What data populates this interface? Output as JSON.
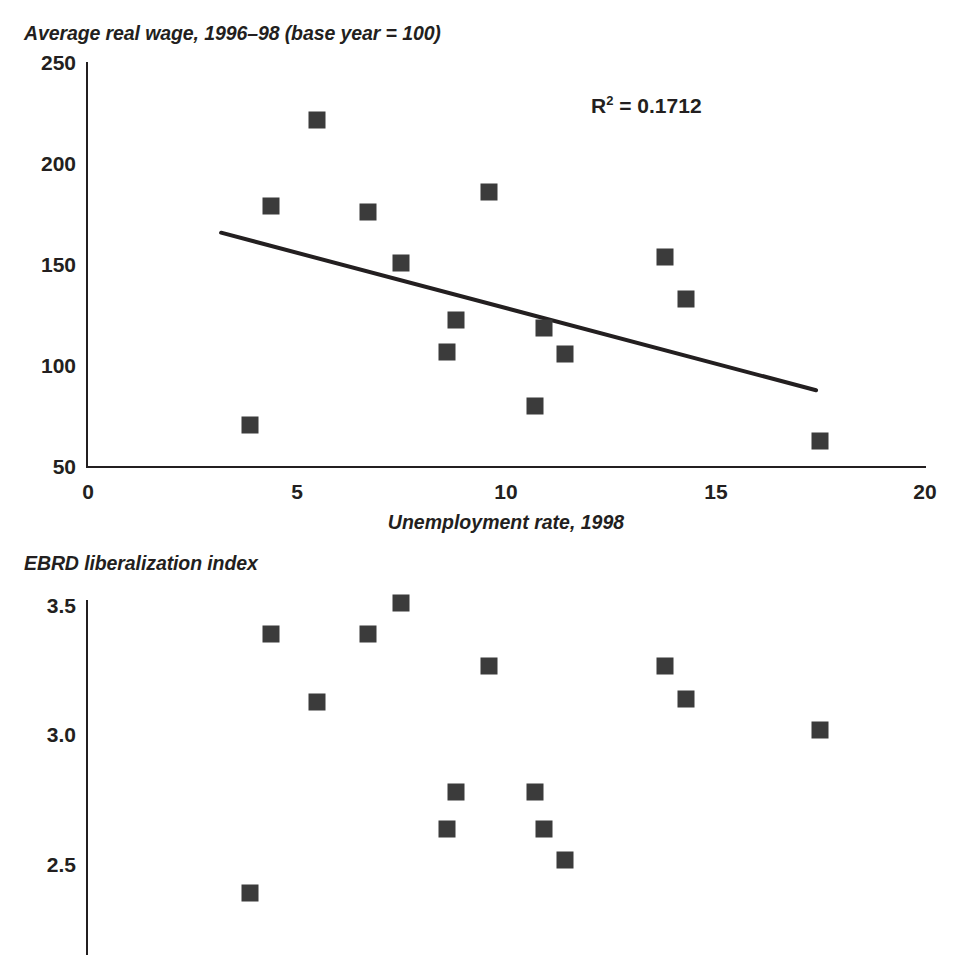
{
  "figure": {
    "marker_color": "#3b3b3b",
    "axis_color": "#231f20"
  },
  "chart_data": [
    {
      "type": "scatter",
      "title": "Average real wage, 1996–98 (base year = 100)",
      "xlabel": "Unemployment rate, 1998",
      "ylabel": "Average real wage, 1996–98 (base year = 100)",
      "xlim": [
        0,
        20
      ],
      "ylim": [
        50,
        250
      ],
      "xticks": [
        "0",
        "5",
        "10",
        "15",
        "20"
      ],
      "yticks": [
        "250",
        "200",
        "150",
        "100",
        "50"
      ],
      "grid": false,
      "legend": "none",
      "annotations": [
        {
          "text_prefix": "R",
          "text_sup": "2",
          "text_suffix": " = 0.1712",
          "full_text": "R2 = 0.1712"
        }
      ],
      "trendline": {
        "x0": 3.2,
        "y0": 166,
        "x1": 17.4,
        "y1": 88
      },
      "points": [
        {
          "x": 3.9,
          "y": 71
        },
        {
          "x": 4.4,
          "y": 179
        },
        {
          "x": 5.5,
          "y": 222
        },
        {
          "x": 6.7,
          "y": 176
        },
        {
          "x": 7.5,
          "y": 151
        },
        {
          "x": 8.6,
          "y": 107
        },
        {
          "x": 8.8,
          "y": 123
        },
        {
          "x": 9.6,
          "y": 186
        },
        {
          "x": 10.7,
          "y": 80
        },
        {
          "x": 10.9,
          "y": 119
        },
        {
          "x": 11.4,
          "y": 106
        },
        {
          "x": 13.8,
          "y": 154
        },
        {
          "x": 14.3,
          "y": 133
        },
        {
          "x": 17.5,
          "y": 63
        }
      ]
    },
    {
      "type": "scatter",
      "title": "EBRD liberalization index",
      "xlabel": "",
      "ylabel": "EBRD liberalization index",
      "xlim": [
        0,
        20
      ],
      "ylim": [
        2.25,
        3.6
      ],
      "xticks": [],
      "yticks": [
        "3.5",
        "3.0",
        "2.5"
      ],
      "grid": false,
      "legend": "none",
      "annotations": [],
      "points": [
        {
          "x": 3.9,
          "y": 2.39
        },
        {
          "x": 4.4,
          "y": 3.39
        },
        {
          "x": 5.5,
          "y": 3.13
        },
        {
          "x": 6.7,
          "y": 3.39
        },
        {
          "x": 7.5,
          "y": 3.51
        },
        {
          "x": 8.6,
          "y": 2.64
        },
        {
          "x": 8.8,
          "y": 2.78
        },
        {
          "x": 9.6,
          "y": 3.27
        },
        {
          "x": 10.7,
          "y": 2.78
        },
        {
          "x": 10.9,
          "y": 2.64
        },
        {
          "x": 11.4,
          "y": 2.52
        },
        {
          "x": 13.8,
          "y": 3.27
        },
        {
          "x": 14.3,
          "y": 3.14
        },
        {
          "x": 17.5,
          "y": 3.02
        }
      ]
    }
  ],
  "top_chart": {
    "title": "Average real wage, 1996–98 (base year = 100)",
    "y_ticks": [
      "250",
      "200",
      "150",
      "100",
      "50"
    ],
    "x_ticks": [
      "0",
      "5",
      "10",
      "15",
      "20"
    ],
    "x_axis_title": "Unemployment rate, 1998",
    "r_squared_label": "R",
    "r_squared_sup": "2",
    "r_squared_value": " = 0.1712"
  },
  "bottom_chart": {
    "title": "EBRD liberalization index",
    "y_ticks": [
      "3.5",
      "3.0",
      "2.5"
    ]
  }
}
